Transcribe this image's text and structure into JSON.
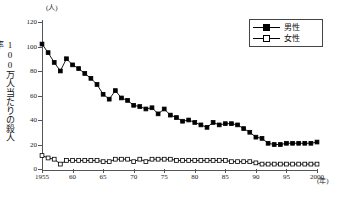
{
  "chart_data": {
    "type": "line",
    "title": "",
    "xlabel": "(年)",
    "ylabel": "100万人当たりの殺人率",
    "yunit": "(人)",
    "xlim": [
      1955,
      2000
    ],
    "ylim": [
      0,
      120
    ],
    "yticks": [
      0,
      20,
      40,
      60,
      80,
      100,
      120
    ],
    "ytick_labels": [
      "0",
      "20",
      "40",
      "60",
      "80",
      "100",
      "120"
    ],
    "xticks": [
      1955,
      1960,
      1965,
      1970,
      1975,
      1980,
      1985,
      1990,
      1995,
      2000
    ],
    "xtick_labels": [
      "1955",
      "60",
      "65",
      "70",
      "75",
      "80",
      "85",
      "90",
      "95",
      "2000"
    ],
    "grid": false,
    "legend_position": "top-right",
    "x": [
      1955,
      1956,
      1957,
      1958,
      1959,
      1960,
      1961,
      1962,
      1963,
      1964,
      1965,
      1966,
      1967,
      1968,
      1969,
      1970,
      1971,
      1972,
      1973,
      1974,
      1975,
      1976,
      1977,
      1978,
      1979,
      1980,
      1981,
      1982,
      1983,
      1984,
      1985,
      1986,
      1987,
      1988,
      1989,
      1990,
      1991,
      1992,
      1993,
      1994,
      1995,
      1996,
      1997,
      1998,
      1999,
      2000
    ],
    "series": [
      {
        "name": "男性",
        "marker": "filled-square",
        "values": [
          102,
          95,
          87,
          80,
          90,
          85,
          82,
          78,
          74,
          69,
          61,
          57,
          64,
          58,
          56,
          52,
          51,
          49,
          50,
          45,
          49,
          44,
          42,
          39,
          40,
          38,
          36,
          34,
          38,
          36,
          37,
          37,
          36,
          33,
          30,
          26,
          25,
          21,
          20,
          20,
          21,
          21,
          21,
          21,
          21,
          22
        ]
      },
      {
        "name": "女性",
        "marker": "open-square",
        "values": [
          11,
          9,
          8,
          4,
          7,
          7,
          7,
          7,
          7,
          7,
          6,
          6,
          8,
          8,
          8,
          6,
          8,
          6,
          8,
          8,
          8,
          8,
          7,
          7,
          7,
          7,
          7,
          7,
          7,
          7,
          7,
          6,
          6,
          6,
          6,
          5,
          4,
          4,
          4,
          4,
          4,
          4,
          4,
          4,
          4,
          4
        ]
      }
    ]
  },
  "legend": {
    "items": [
      {
        "label": "男性",
        "marker": "filled-square"
      },
      {
        "label": "女性",
        "marker": "open-square"
      }
    ]
  }
}
